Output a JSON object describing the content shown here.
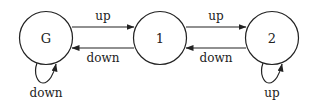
{
  "diagram": {
    "type": "state-machine",
    "colors": {
      "stroke": "#222222",
      "background": "#ffffff",
      "text": "#222222"
    },
    "nodes": [
      {
        "id": "G",
        "label": "G"
      },
      {
        "id": "1",
        "label": "1"
      },
      {
        "id": "2",
        "label": "2"
      }
    ],
    "edges": [
      {
        "from": "G",
        "to": "1",
        "label": "up"
      },
      {
        "from": "1",
        "to": "G",
        "label": "down"
      },
      {
        "from": "1",
        "to": "2",
        "label": "up"
      },
      {
        "from": "2",
        "to": "1",
        "label": "down"
      },
      {
        "from": "G",
        "to": "G",
        "label": "down"
      },
      {
        "from": "2",
        "to": "2",
        "label": "up"
      }
    ]
  }
}
